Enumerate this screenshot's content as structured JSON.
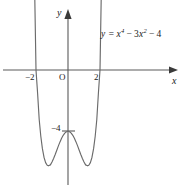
{
  "figure": {
    "name": "quartic-function-graph",
    "background_color": "#ffffff",
    "curve_color": "#6b6b6b",
    "axis_color": "#5a5a5a",
    "text_color": "#1a1a1a"
  },
  "labels": {
    "y_axis": "y",
    "x_axis": "x",
    "origin": "O",
    "tick_neg_two": "−2",
    "tick_two": "2",
    "tick_neg_four": "−4",
    "equation_prefix": "y =",
    "equation_full": "y = x⁴ − 3x² − 4",
    "eq_var_x1": "x",
    "eq_exp1": "4",
    "eq_minus1": "−",
    "eq_coef": "3",
    "eq_var_x2": "x",
    "eq_exp2": "2",
    "eq_minus2": "−",
    "eq_const": "4"
  },
  "chart_data": {
    "type": "line",
    "title": "",
    "xlabel": "x",
    "ylabel": "y",
    "equation": "y = x^4 - 3x^2 - 4",
    "grid": false,
    "legend": "none",
    "annotations": [
      "y = x⁴ − 3x² − 4"
    ],
    "xlim": [
      -3.1,
      3.1
    ],
    "ylim": [
      -7.8,
      4.5
    ],
    "xticks": [
      -2,
      2
    ],
    "xticklabels": [
      "−2",
      "2"
    ],
    "yticks": [
      -4
    ],
    "yticklabels": [
      "−4"
    ],
    "roots": [
      -2,
      2
    ],
    "y_intercept": -4,
    "local_maximum": {
      "x": 0,
      "y": -4
    },
    "local_minima": [
      {
        "x": -1.2247,
        "y": -6.25
      },
      {
        "x": 1.2247,
        "y": -6.25
      }
    ],
    "series": [
      {
        "name": "y = x^4 - 3x^2 - 4",
        "x": [
          -2.55,
          -2.4,
          -2.3,
          -2.2,
          -2.1,
          -2.0,
          -1.9,
          -1.8,
          -1.7,
          -1.6,
          -1.5,
          -1.4,
          -1.3,
          -1.2247,
          -1.1,
          -1.0,
          -0.9,
          -0.8,
          -0.7,
          -0.6,
          -0.5,
          -0.4,
          -0.3,
          -0.2,
          -0.1,
          0.0,
          0.1,
          0.2,
          0.3,
          0.4,
          0.5,
          0.6,
          0.7,
          0.8,
          0.9,
          1.0,
          1.1,
          1.2247,
          1.3,
          1.4,
          1.5,
          1.6,
          1.7,
          1.8,
          1.9,
          2.0,
          2.1,
          2.2,
          2.3,
          2.4,
          2.55
        ],
        "y": [
          22.78,
          15.9,
          11.12,
          8.9,
          6.22,
          0.0,
          -1.52,
          -3.23,
          -4.32,
          -5.13,
          -5.69,
          -6.04,
          -6.21,
          -6.25,
          -6.19,
          -6.0,
          -5.77,
          -5.51,
          -5.23,
          -4.95,
          -4.69,
          -4.45,
          -4.26,
          -4.12,
          -4.03,
          -4.0,
          -4.03,
          -4.12,
          -4.26,
          -4.45,
          -4.69,
          -4.95,
          -5.23,
          -5.51,
          -5.77,
          -6.0,
          -6.19,
          -6.25,
          -6.21,
          -6.04,
          -5.69,
          -5.13,
          -4.32,
          -3.23,
          -1.52,
          0.0,
          6.22,
          8.9,
          11.12,
          15.9,
          22.78
        ]
      }
    ]
  }
}
